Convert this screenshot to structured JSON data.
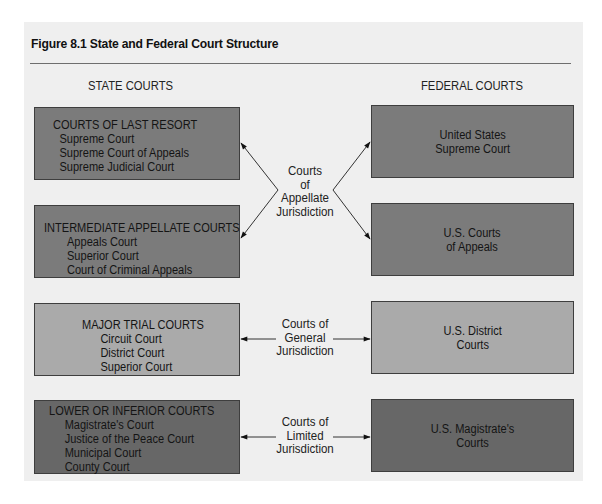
{
  "figure": {
    "title": "Figure 8.1  State and Federal Court Structure",
    "colors": {
      "panel_background": "#efefef",
      "appellate_box": "#7b7b7b",
      "general_box": "#aaaaaa",
      "limited_box": "#676767"
    }
  },
  "state": {
    "heading": "STATE COURTS",
    "boxes": [
      {
        "heading": "COURTS OF LAST RESORT",
        "items": [
          "Supreme Court",
          "Supreme Court of Appeals",
          "Supreme Judicial Court"
        ]
      },
      {
        "heading": "INTERMEDIATE APPELLATE COURTS",
        "items": [
          "Appeals Court",
          "Superior Court",
          "Court of Criminal Appeals"
        ]
      },
      {
        "heading": "MAJOR TRIAL COURTS",
        "items": [
          "Circuit Court",
          "District Court",
          "Superior Court"
        ]
      },
      {
        "heading": "LOWER OR INFERIOR COURTS",
        "items": [
          "Magistrate's Court",
          "Justice of the Peace Court",
          "Municipal Court",
          "County Court"
        ]
      }
    ]
  },
  "federal": {
    "heading": "FEDERAL COURTS",
    "boxes": [
      {
        "lines": [
          "United States",
          "Supreme Court"
        ]
      },
      {
        "lines": [
          "U.S. Courts",
          "of Appeals"
        ]
      },
      {
        "lines": [
          "U.S. District",
          "Courts"
        ]
      },
      {
        "lines": [
          "U.S. Magistrate's",
          "Courts"
        ]
      }
    ]
  },
  "jurisdictions": [
    {
      "lines": [
        "Courts",
        "of",
        "Appellate",
        "Jurisdiction"
      ]
    },
    {
      "lines": [
        "Courts of",
        "General",
        "Jurisdiction"
      ]
    },
    {
      "lines": [
        "Courts of",
        "Limited",
        "Jurisdiction"
      ]
    }
  ]
}
